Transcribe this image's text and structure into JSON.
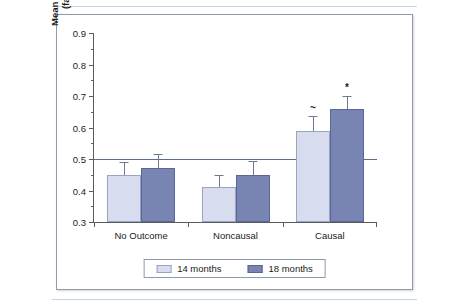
{
  "chart_data": {
    "type": "bar",
    "title": "",
    "xlabel": "",
    "ylabel": "Mean proportion of trials",
    "ylabel_line2": "(familiar choices)",
    "categories": [
      "No Outcome",
      "Noncausal",
      "Causal"
    ],
    "ylim": [
      0.3,
      0.9
    ],
    "ytick_labels": [
      "0.3",
      "0.4",
      "0.5",
      "0.6",
      "0.7",
      "0.8",
      "0.9"
    ],
    "ytick_values": [
      0.3,
      0.4,
      0.5,
      0.6,
      0.7,
      0.8,
      0.9
    ],
    "ytick_minor_values": [
      0.35,
      0.45,
      0.55,
      0.65,
      0.75,
      0.85
    ],
    "grid": false,
    "legend_position": "bottom-center",
    "reference_line": {
      "value": 0.5,
      "label": "chance level",
      "color": "#5d6b8e"
    },
    "series": [
      {
        "name": "14 months",
        "color": "#d7dcee",
        "border_color": "#9aa4c4",
        "values": [
          0.45,
          0.41,
          0.59
        ],
        "errors": [
          0.04,
          0.04,
          0.045
        ],
        "markers": [
          "",
          "",
          "~"
        ]
      },
      {
        "name": "18 months",
        "color": "#7884b2",
        "border_color": "#5a6697",
        "values": [
          0.47,
          0.45,
          0.66
        ],
        "errors": [
          0.045,
          0.045,
          0.04
        ],
        "markers": [
          "",
          "",
          "*"
        ]
      }
    ]
  },
  "legend": {
    "items": [
      {
        "label": "14 months"
      },
      {
        "label": "18 months"
      }
    ]
  }
}
